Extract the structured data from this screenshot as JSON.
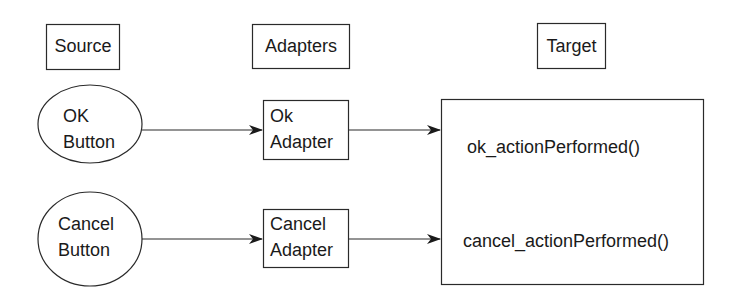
{
  "diagram": {
    "headers": {
      "source": "Source",
      "adapters": "Adapters",
      "target": "Target"
    },
    "sources": [
      {
        "line1": "OK",
        "line2": "Button",
        "shape": "ellipse"
      },
      {
        "line1": "Cancel",
        "line2": "Button",
        "shape": "ellipse"
      }
    ],
    "adapters": [
      {
        "line1": "Ok",
        "line2": "Adapter",
        "shape": "rectangle"
      },
      {
        "line1": "Cancel",
        "line2": "Adapter",
        "shape": "rectangle"
      }
    ],
    "target": {
      "methods": [
        "ok_actionPerformed()",
        "cancel_actionPerformed()"
      ]
    },
    "edges": [
      {
        "from": "OK Button",
        "to": "Ok Adapter"
      },
      {
        "from": "Ok Adapter",
        "to": "ok_actionPerformed()"
      },
      {
        "from": "Cancel Button",
        "to": "Cancel Adapter"
      },
      {
        "from": "Cancel Adapter",
        "to": "cancel_actionPerformed()"
      }
    ],
    "colors": {
      "stroke": "#2a2a2a",
      "background": "#ffffff",
      "text": "#1a1a1a"
    }
  }
}
